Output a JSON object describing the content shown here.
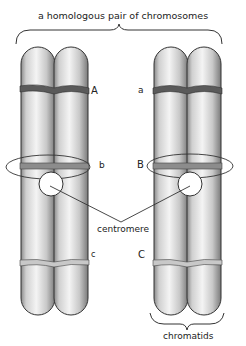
{
  "diagram": {
    "title": "a homologous pair of chromosomes",
    "left_chromosome": {
      "gene_labels": {
        "top": "A",
        "middle": "b",
        "bottom": "c"
      }
    },
    "right_chromosome": {
      "gene_labels": {
        "top": "a",
        "middle": "B",
        "bottom": "C"
      }
    },
    "annotations": {
      "centromere": "centromere",
      "chromatids": "chromatids"
    },
    "colors": {
      "band_top": "#5a5a5a",
      "band_middle": "#8c8c8c",
      "band_bottom": "#c8c8c8",
      "outline": "#333333"
    }
  }
}
